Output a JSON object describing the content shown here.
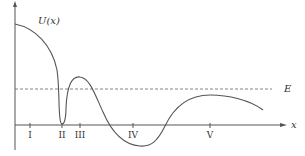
{
  "diagram": {
    "curve_label": "U(x)",
    "energy_label": "E",
    "x_axis_label": "x",
    "colors": {
      "curve": "#555555",
      "axis": "#555555",
      "energy_line": "#666666",
      "background": "#ffffff"
    },
    "regions": [
      {
        "label": "I",
        "x": 30
      },
      {
        "label": "II",
        "x": 62
      },
      {
        "label": "III",
        "x": 80
      },
      {
        "label": "IV",
        "x": 133
      },
      {
        "label": "V",
        "x": 210
      }
    ]
  }
}
